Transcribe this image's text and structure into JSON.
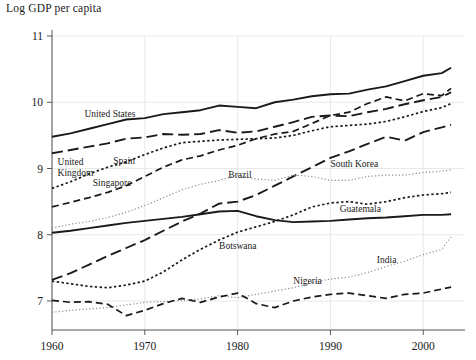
{
  "chart_data": {
    "type": "line",
    "title": "Log GDP per capita",
    "xlabel": "",
    "ylabel": "",
    "xlim": [
      1960,
      2004
    ],
    "ylim": [
      6.6,
      11.2
    ],
    "grid": true,
    "legend_position": "inline-labels",
    "xticks": [
      1960,
      1970,
      1980,
      1990,
      2000
    ],
    "yticks": [
      7,
      8,
      9,
      10,
      11
    ],
    "x": [
      1960,
      1962,
      1964,
      1966,
      1968,
      1970,
      1972,
      1974,
      1976,
      1978,
      1980,
      1982,
      1984,
      1986,
      1988,
      1990,
      1992,
      1994,
      1996,
      1998,
      2000,
      2002,
      2003
    ],
    "series": [
      {
        "name": "United States",
        "style": "solid",
        "label_x": 1963.5,
        "label_y": 9.78,
        "values": [
          9.48,
          9.53,
          9.6,
          9.67,
          9.74,
          9.76,
          9.82,
          9.85,
          9.88,
          9.95,
          9.93,
          9.91,
          10.0,
          10.04,
          10.09,
          10.12,
          10.13,
          10.19,
          10.24,
          10.32,
          10.4,
          10.44,
          10.52
        ]
      },
      {
        "name": "United Kingdom",
        "style": "longdash",
        "label_x": 1960.6,
        "label_y": 9.06,
        "label_line2": "Kingdom",
        "values": [
          9.23,
          9.28,
          9.33,
          9.38,
          9.45,
          9.47,
          9.52,
          9.51,
          9.52,
          9.58,
          9.54,
          9.56,
          9.63,
          9.7,
          9.78,
          9.8,
          9.79,
          9.85,
          9.9,
          9.97,
          10.03,
          10.08,
          10.15
        ]
      },
      {
        "name": "Spain",
        "style": "dotted",
        "label_x": 1966.6,
        "label_y": 9.07,
        "values": [
          8.7,
          8.8,
          8.92,
          9.02,
          9.1,
          9.21,
          9.31,
          9.39,
          9.41,
          9.43,
          9.44,
          9.45,
          9.46,
          9.5,
          9.57,
          9.63,
          9.65,
          9.67,
          9.71,
          9.78,
          9.86,
          9.92,
          9.98
        ]
      },
      {
        "name": "Singapore",
        "style": "dash",
        "label_x": 1964.4,
        "label_y": 8.74,
        "values": [
          8.42,
          8.49,
          8.56,
          8.64,
          8.74,
          8.88,
          9.02,
          9.13,
          9.19,
          9.28,
          9.35,
          9.45,
          9.52,
          9.56,
          9.68,
          9.8,
          9.85,
          9.98,
          10.08,
          10.02,
          10.13,
          10.1,
          10.21
        ]
      },
      {
        "name": "South Korea",
        "style": "longdash",
        "label_x": 1990.0,
        "label_y": 9.02,
        "values": [
          7.32,
          7.42,
          7.55,
          7.68,
          7.8,
          7.92,
          8.06,
          8.2,
          8.32,
          8.47,
          8.5,
          8.6,
          8.74,
          8.88,
          9.02,
          9.16,
          9.26,
          9.37,
          9.48,
          9.42,
          9.55,
          9.62,
          9.66
        ]
      },
      {
        "name": "Brazil",
        "style": "finedot",
        "label_x": 1979.0,
        "label_y": 8.86,
        "values": [
          8.1,
          8.16,
          8.2,
          8.26,
          8.34,
          8.44,
          8.56,
          8.68,
          8.76,
          8.82,
          8.9,
          8.84,
          8.82,
          8.9,
          8.88,
          8.82,
          8.82,
          8.88,
          8.9,
          8.9,
          8.94,
          8.96,
          8.98
        ]
      },
      {
        "name": "Guatemala",
        "style": "solid",
        "label_x": 1991.0,
        "label_y": 8.34,
        "values": [
          8.03,
          8.06,
          8.1,
          8.14,
          8.18,
          8.21,
          8.24,
          8.27,
          8.31,
          8.35,
          8.36,
          8.28,
          8.22,
          8.19,
          8.2,
          8.21,
          8.23,
          8.25,
          8.26,
          8.28,
          8.3,
          8.3,
          8.31
        ]
      },
      {
        "name": "Botswana",
        "style": "dotted",
        "label_x": 1978.0,
        "label_y": 7.79,
        "values": [
          7.3,
          7.26,
          7.22,
          7.2,
          7.24,
          7.3,
          7.44,
          7.62,
          7.78,
          7.92,
          8.04,
          8.12,
          8.2,
          8.3,
          8.42,
          8.48,
          8.5,
          8.46,
          8.5,
          8.56,
          8.6,
          8.62,
          8.64
        ]
      },
      {
        "name": "India",
        "style": "finedot",
        "label_x": 1995.0,
        "label_y": 7.58,
        "values": [
          6.83,
          6.86,
          6.88,
          6.9,
          6.94,
          6.98,
          6.99,
          7.01,
          7.03,
          7.08,
          7.05,
          7.1,
          7.15,
          7.2,
          7.28,
          7.33,
          7.36,
          7.43,
          7.52,
          7.6,
          7.7,
          7.78,
          7.97
        ]
      },
      {
        "name": "Nigeria",
        "style": "dash",
        "label_x": 1986.0,
        "label_y": 7.26,
        "values": [
          7.01,
          6.98,
          6.99,
          6.95,
          6.78,
          6.86,
          6.96,
          7.04,
          6.98,
          7.06,
          7.12,
          6.96,
          6.9,
          7.0,
          7.06,
          7.1,
          7.12,
          7.08,
          7.04,
          7.1,
          7.12,
          7.18,
          7.21
        ]
      }
    ]
  }
}
